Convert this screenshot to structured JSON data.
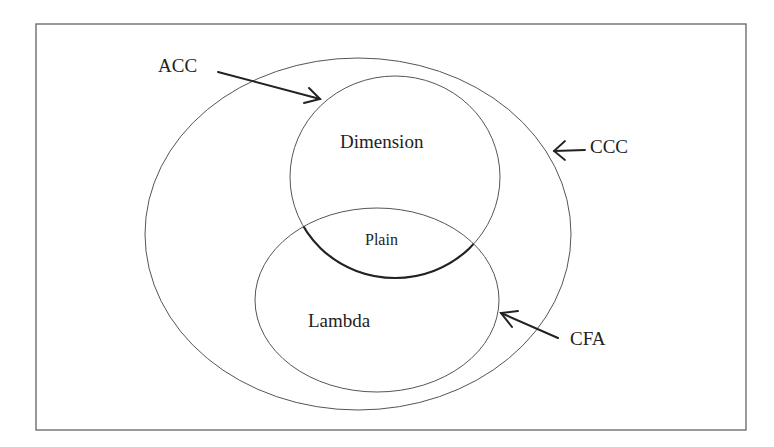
{
  "diagram": {
    "type": "nested-venn",
    "frame": true,
    "stroke_color": "#555555",
    "sets": [
      {
        "id": "ccc",
        "label": "CCC",
        "shape": "ellipse",
        "contains": [
          "dimension",
          "lambda"
        ]
      },
      {
        "id": "dimension",
        "label": "Dimension",
        "shape": "ellipse"
      },
      {
        "id": "lambda",
        "label": "Lambda",
        "shape": "ellipse"
      },
      {
        "id": "plain",
        "label": "Plain",
        "region": "intersection(dimension, lambda)"
      }
    ],
    "callouts": [
      {
        "label": "ACC",
        "points_to": "dimension"
      },
      {
        "label": "CCC",
        "points_to": "ccc"
      },
      {
        "label": "CFA",
        "points_to": "lambda"
      }
    ],
    "labels": {
      "acc": "ACC",
      "ccc": "CCC",
      "cfa": "CFA",
      "dimension": "Dimension",
      "plain": "Plain",
      "lambda": "Lambda"
    }
  }
}
